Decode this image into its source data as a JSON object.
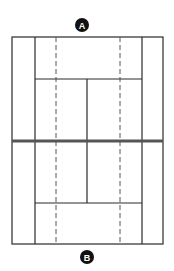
{
  "diagram": {
    "type": "tennis-court",
    "label_top": "A",
    "label_bottom": "B",
    "line_color": "#2a2a2a",
    "net_color": "#555555",
    "badge_color": "#111111"
  }
}
